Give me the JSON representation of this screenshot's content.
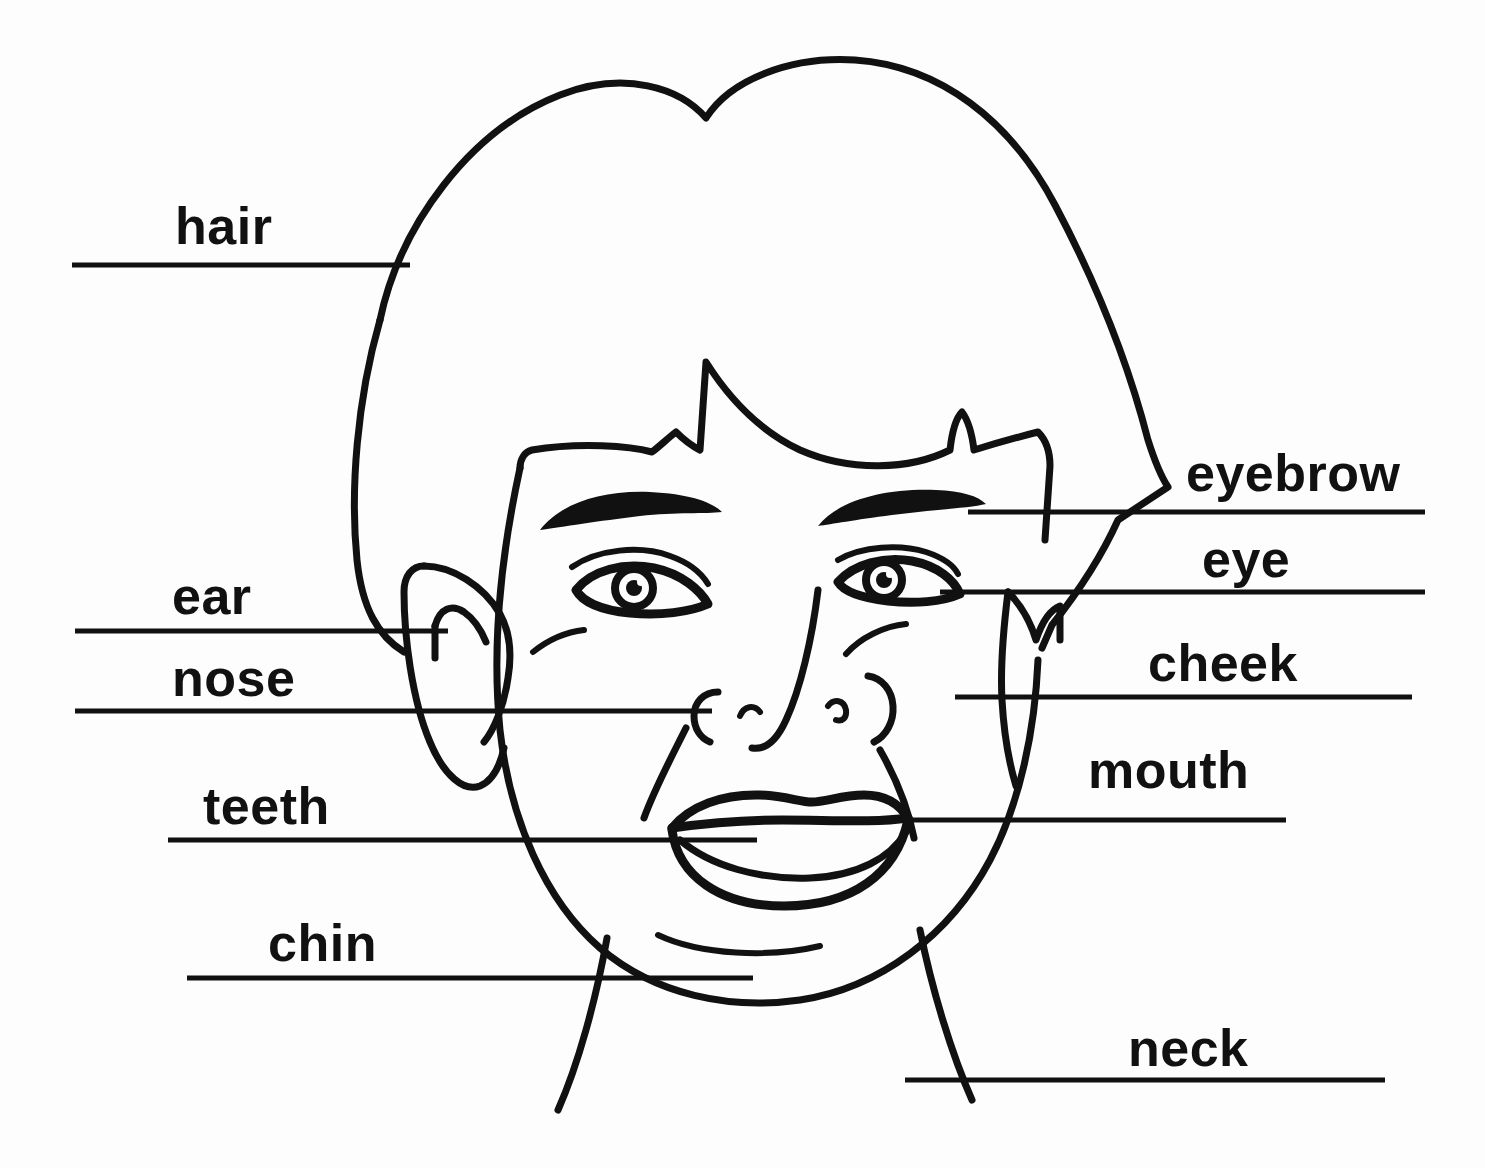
{
  "diagram": {
    "background_color": "#fdfdfd",
    "ink_color": "#111111",
    "labels": [
      {
        "id": "hair",
        "text": "hair",
        "side": "left",
        "x": 175,
        "y": 200,
        "line": {
          "x1": 72,
          "y1": 265,
          "x2": 410,
          "y2": 265
        }
      },
      {
        "id": "ear",
        "text": "ear",
        "side": "left",
        "x": 172,
        "y": 570,
        "line": {
          "x1": 75,
          "y1": 631,
          "x2": 448,
          "y2": 631
        }
      },
      {
        "id": "nose",
        "text": "nose",
        "side": "left",
        "x": 172,
        "y": 652,
        "line": {
          "x1": 75,
          "y1": 711,
          "x2": 712,
          "y2": 711
        }
      },
      {
        "id": "teeth",
        "text": "teeth",
        "side": "left",
        "x": 203,
        "y": 780,
        "line": {
          "x1": 168,
          "y1": 840,
          "x2": 757,
          "y2": 840
        }
      },
      {
        "id": "chin",
        "text": "chin",
        "side": "left",
        "x": 268,
        "y": 917,
        "line": {
          "x1": 187,
          "y1": 978,
          "x2": 753,
          "y2": 978
        }
      },
      {
        "id": "eyebrow",
        "text": "eyebrow",
        "side": "right",
        "x": 1186,
        "y": 447,
        "line": {
          "x1": 968,
          "y1": 512,
          "x2": 1425,
          "y2": 512
        }
      },
      {
        "id": "eye",
        "text": "eye",
        "side": "right",
        "x": 1202,
        "y": 533,
        "line": {
          "x1": 940,
          "y1": 592,
          "x2": 1425,
          "y2": 592
        }
      },
      {
        "id": "cheek",
        "text": "cheek",
        "side": "right",
        "x": 1148,
        "y": 637,
        "line": {
          "x1": 955,
          "y1": 697,
          "x2": 1412,
          "y2": 697
        }
      },
      {
        "id": "mouth",
        "text": "mouth",
        "side": "right",
        "x": 1088,
        "y": 744,
        "line": {
          "x1": 825,
          "y1": 820,
          "x2": 1286,
          "y2": 820
        }
      },
      {
        "id": "neck",
        "text": "neck",
        "side": "right",
        "x": 1128,
        "y": 1022,
        "line": {
          "x1": 905,
          "y1": 1080,
          "x2": 1385,
          "y2": 1080
        }
      }
    ]
  }
}
